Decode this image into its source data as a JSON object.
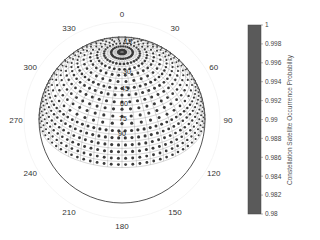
{
  "chart_data": {
    "type": "scatter",
    "subtype": "polar-skyplot",
    "title": "",
    "angular_ticks": [
      "0",
      "30",
      "60",
      "90",
      "120",
      "150",
      "180",
      "210",
      "240",
      "270",
      "300",
      "330"
    ],
    "angular_tick_values": [
      0,
      30,
      60,
      90,
      120,
      150,
      180,
      210,
      240,
      270,
      300,
      330
    ],
    "radial_ticks": [
      "15",
      "30",
      "45",
      "60",
      "75",
      "90"
    ],
    "radial_tick_values": [
      15,
      30,
      45,
      60,
      75,
      90
    ],
    "colorbar": {
      "label": "Constellation Satellite Occurrence  Probability",
      "min": 0.98,
      "max": 1,
      "ticks": [
        "1",
        "0.998",
        "0.996",
        "0.994",
        "0.992",
        "0.99",
        "0.988",
        "0.986",
        "0.984",
        "0.982",
        "0.98"
      ],
      "tick_values": [
        1,
        0.998,
        0.996,
        0.994,
        0.992,
        0.99,
        0.988,
        0.986,
        0.984,
        0.982,
        0.98
      ],
      "color": "#5a5a5a"
    },
    "series": [
      {
        "name": "Satellite occurrence grid points",
        "description": "Dense grid of points covering the full hemisphere (azimuth 0-360, elevation 0-90); all points at probability ~1 (dark markers)",
        "value": 1
      }
    ],
    "colors": {
      "marker": "#3a3a3a",
      "grid": "#777777",
      "outline": "#555555"
    }
  }
}
